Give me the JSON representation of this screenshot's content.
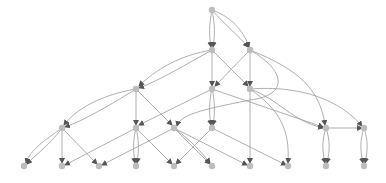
{
  "diagram": {
    "type": "directed-graph",
    "layout": "hierarchical-top-down",
    "colors": {
      "node": "#bdbdbd",
      "edge": "#9a9a9a",
      "arrow": "#555555",
      "background": "#ffffff"
    },
    "nodes": [
      {
        "id": "n0",
        "x": 212,
        "y": 10
      },
      {
        "id": "n1",
        "x": 212,
        "y": 50
      },
      {
        "id": "n2",
        "x": 250,
        "y": 50
      },
      {
        "id": "n3",
        "x": 136,
        "y": 89
      },
      {
        "id": "n4",
        "x": 212,
        "y": 89
      },
      {
        "id": "n5",
        "x": 250,
        "y": 89
      },
      {
        "id": "n6",
        "x": 62,
        "y": 128
      },
      {
        "id": "n7",
        "x": 136,
        "y": 128
      },
      {
        "id": "n8",
        "x": 174,
        "y": 128
      },
      {
        "id": "n9",
        "x": 212,
        "y": 128
      },
      {
        "id": "n10",
        "x": 326,
        "y": 128
      },
      {
        "id": "n11",
        "x": 364,
        "y": 128
      },
      {
        "id": "n12",
        "x": 24,
        "y": 166
      },
      {
        "id": "n13",
        "x": 62,
        "y": 166
      },
      {
        "id": "n14",
        "x": 99,
        "y": 166
      },
      {
        "id": "n15",
        "x": 136,
        "y": 166
      },
      {
        "id": "n16",
        "x": 174,
        "y": 166
      },
      {
        "id": "n17",
        "x": 212,
        "y": 166
      },
      {
        "id": "n18",
        "x": 250,
        "y": 166
      },
      {
        "id": "n19",
        "x": 288,
        "y": 166
      },
      {
        "id": "n20",
        "x": 326,
        "y": 166
      },
      {
        "id": "n21",
        "x": 364,
        "y": 166
      }
    ],
    "edges": [
      {
        "d": "M212,10 C209,25 209,35 211,47"
      },
      {
        "d": "M212,10 C215,25 215,35 213,47"
      },
      {
        "d": "M212,10 C225,25 238,35 248,47"
      },
      {
        "d": "M212,10 C235,18 245,35 249,47"
      },
      {
        "d": "M212,50 C180,55 155,70 139,86"
      },
      {
        "d": "M212,50 C185,65 160,80 139,88"
      },
      {
        "d": "M212,50 L212,86"
      },
      {
        "d": "M212,50 L248,86"
      },
      {
        "d": "M250,50 L215,86"
      },
      {
        "d": "M250,50 L250,86"
      },
      {
        "d": "M250,50 C300,70 320,90 325,125"
      },
      {
        "d": "M250,50 C285,70 290,95 250,100 C200,110 180,115 177,126"
      },
      {
        "d": "M136,89 C100,95 75,110 64,125"
      },
      {
        "d": "M136,89 C110,105 85,120 65,127"
      },
      {
        "d": "M136,89 L136,125"
      },
      {
        "d": "M136,89 L172,125"
      },
      {
        "d": "M212,89 L139,125"
      },
      {
        "d": "M212,89 C209,100 209,115 211,125"
      },
      {
        "d": "M212,89 C215,100 215,115 213,125"
      },
      {
        "d": "M212,89 L323,127"
      },
      {
        "d": "M250,89 L250,163"
      },
      {
        "d": "M250,89 C280,100 290,120 323,128"
      },
      {
        "d": "M250,89 C300,85 340,100 362,126"
      },
      {
        "d": "M250,89 C280,110 290,130 288,163"
      },
      {
        "d": "M62,128 C45,140 30,150 26,163"
      },
      {
        "d": "M62,128 C50,145 35,155 27,164"
      },
      {
        "d": "M62,128 L62,163"
      },
      {
        "d": "M62,128 L97,164"
      },
      {
        "d": "M136,128 C133,140 133,150 135,163"
      },
      {
        "d": "M136,128 C139,140 139,150 137,163"
      },
      {
        "d": "M136,128 L172,164"
      },
      {
        "d": "M136,128 L65,165"
      },
      {
        "d": "M174,128 L210,164"
      },
      {
        "d": "M174,128 C190,140 200,150 210,163"
      },
      {
        "d": "M174,128 L102,165"
      },
      {
        "d": "M174,128 L247,165"
      },
      {
        "d": "M212,128 L176,164"
      },
      {
        "d": "M212,128 L286,165"
      },
      {
        "d": "M326,128 L362,128"
      },
      {
        "d": "M326,128 C322,140 322,150 325,163"
      },
      {
        "d": "M326,128 C330,140 330,150 327,163"
      },
      {
        "d": "M364,128 C360,140 360,150 363,163"
      },
      {
        "d": "M364,128 C368,140 368,150 365,163"
      }
    ]
  }
}
